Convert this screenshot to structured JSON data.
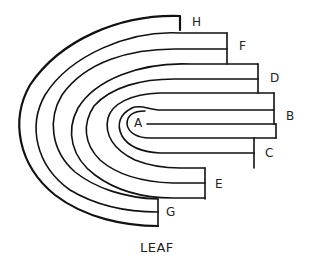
{
  "diagram": {
    "title": "LEAF",
    "labels": {
      "A": "A",
      "B": "B",
      "C": "C",
      "D": "D",
      "E": "E",
      "F": "F",
      "G": "G",
      "H": "H"
    },
    "colors": {
      "stroke": "#111111",
      "background": "#ffffff",
      "text": "#222222"
    }
  }
}
